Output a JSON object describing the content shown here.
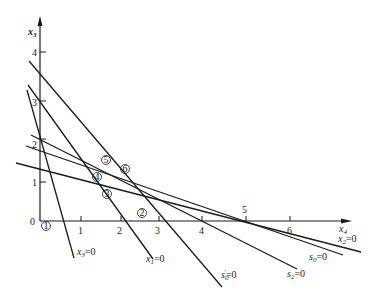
{
  "diagram": {
    "axes": {
      "y_label": "x",
      "y_label_sub": "3",
      "x_label": "x",
      "x_label_sub": "4",
      "origin_label": "0",
      "x_ticks": [
        "1",
        "2",
        "3",
        "4",
        "5",
        "6"
      ],
      "y_ticks": [
        "1",
        "2",
        "3",
        "4"
      ]
    },
    "lines": [
      {
        "id": "x3",
        "label_var": "x",
        "label_sub": "3",
        "label_eq": "=0"
      },
      {
        "id": "x1",
        "label_var": "x",
        "label_sub": "1",
        "label_eq": "=0"
      },
      {
        "id": "s0p",
        "label_var": "s",
        "label_sub": "0",
        "label_sup": "′",
        "label_eq": "=0"
      },
      {
        "id": "s2",
        "label_var": "s",
        "label_sub": "2",
        "label_eq": "=0"
      },
      {
        "id": "s0",
        "label_var": "s",
        "label_sub": "0",
        "label_eq": "=0"
      },
      {
        "id": "x2",
        "label_var": "x",
        "label_sub": "2",
        "label_eq": "=0"
      }
    ],
    "points": [
      {
        "label": "1"
      },
      {
        "label": "2"
      },
      {
        "label": "3"
      },
      {
        "label": "4"
      },
      {
        "label": "5"
      },
      {
        "label": "6"
      }
    ]
  }
}
